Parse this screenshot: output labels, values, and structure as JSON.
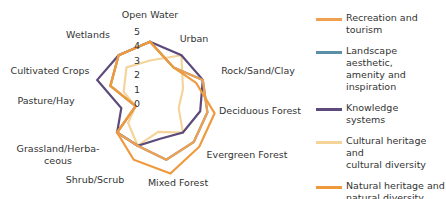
{
  "chart_data": {
    "type": "radar",
    "title": "",
    "axes": [
      "Open Water",
      "Urban",
      "Rock/Sand/Clay",
      "Deciduous Forest",
      "Evergreen Forest",
      "Mixed Forest",
      "Shrub/Scrub",
      "Grassland/Herbaceous",
      "Pasture/Hay",
      "Cultivated Crops",
      "Wetlands"
    ],
    "axis_label_display": [
      "Open Water",
      "Urban",
      "Rock/Sand/Clay",
      "Deciduous Forest",
      "Evergreen Forest",
      "Mixed Forest",
      "Shrub/Scrub",
      "Grassland/Herba-|ceous",
      "Pasture/Hay",
      "Cultivated Crops",
      "Wetlands"
    ],
    "radial_ticks": [
      "0",
      "1",
      "2",
      "3",
      "4",
      "5"
    ],
    "range": [
      0,
      5
    ],
    "grid": false,
    "legend_position": "right",
    "series": [
      {
        "name": "Recreation and tourism",
        "color": "#F0A050",
        "values": [
          4.3,
          3,
          4,
          4,
          4,
          4,
          3,
          3,
          1,
          3,
          4
        ]
      },
      {
        "name": "Landscape aesthetic, amenity and inspiration",
        "color": "#5B8FA8",
        "values": [
          4.3,
          3,
          4,
          4,
          4,
          4,
          3,
          3,
          1,
          3,
          4
        ]
      },
      {
        "name": "Knowledge systems",
        "color": "#5B4A7A",
        "values": [
          4.3,
          4,
          4,
          3.5,
          3,
          2.5,
          3,
          3,
          2,
          4,
          4
        ]
      },
      {
        "name": "Cultural heritage and cultural diversity",
        "color": "#F5D49A",
        "values": [
          3,
          4,
          2.5,
          2,
          3,
          2,
          3,
          2,
          1,
          2,
          3
        ]
      },
      {
        "name": "Natural heritage and natural diversity",
        "color": "#EE9A3C",
        "values": [
          4.3,
          3,
          3.5,
          4.5,
          4.5,
          5,
          4,
          3,
          1,
          3,
          4
        ]
      }
    ]
  },
  "legend": {
    "items": [
      {
        "line1": "Recreation and",
        "line2": "tourism",
        "color": "#F0A050"
      },
      {
        "line1": "Landscape aesthetic,",
        "line2": "amenity and inspiration",
        "color": "#5B8FA8"
      },
      {
        "line1": "Knowledge",
        "line2": "systems",
        "color": "#5B4A7A"
      },
      {
        "line1": "Cultural heritage and",
        "line2": "cultural diversity",
        "color": "#F5D49A"
      },
      {
        "line1": "Natural heritage and",
        "line2": "natural diversity",
        "color": "#EE9A3C"
      }
    ]
  }
}
